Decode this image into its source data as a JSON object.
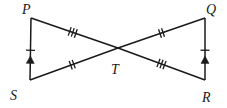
{
  "figure": {
    "canvas": {
      "width": 227,
      "height": 108
    },
    "vertices": [
      {
        "id": "P",
        "label": "P",
        "x": 31,
        "y": 18,
        "label_x": 22,
        "label_y": 14
      },
      {
        "id": "Q",
        "label": "Q",
        "x": 205,
        "y": 18,
        "label_x": 206,
        "label_y": 14
      },
      {
        "id": "S",
        "label": "S",
        "x": 30,
        "y": 80,
        "label_x": 10,
        "label_y": 100
      },
      {
        "id": "R",
        "label": "R",
        "x": 205,
        "y": 80,
        "label_x": 202,
        "label_y": 102
      },
      {
        "id": "T",
        "label": "T",
        "x": 118,
        "y": 48,
        "label_x": 111,
        "label_y": 74
      }
    ],
    "segments": [
      {
        "id": "PS",
        "from": "P",
        "to": "S",
        "ticks": 1,
        "arrow": "up",
        "tick_at": 0.52,
        "arrow_at": 0.7
      },
      {
        "id": "QR",
        "from": "Q",
        "to": "R",
        "ticks": 1,
        "arrow": "up",
        "tick_at": 0.52,
        "arrow_at": 0.7
      },
      {
        "id": "PT",
        "from": "P",
        "to": "T",
        "ticks": 3,
        "arrow": "none",
        "tick_at": 0.48
      },
      {
        "id": "TR",
        "from": "T",
        "to": "R",
        "ticks": 3,
        "arrow": "none",
        "tick_at": 0.5
      },
      {
        "id": "ST",
        "from": "S",
        "to": "T",
        "ticks": 2,
        "arrow": "none",
        "tick_at": 0.48
      },
      {
        "id": "TQ",
        "from": "T",
        "to": "Q",
        "ticks": 2,
        "arrow": "none",
        "tick_at": 0.5
      }
    ],
    "colors": {
      "stroke": "#1a1a1a",
      "background": "#ffffff"
    },
    "tick_style": {
      "length": 9,
      "spacing": 3.2
    }
  }
}
